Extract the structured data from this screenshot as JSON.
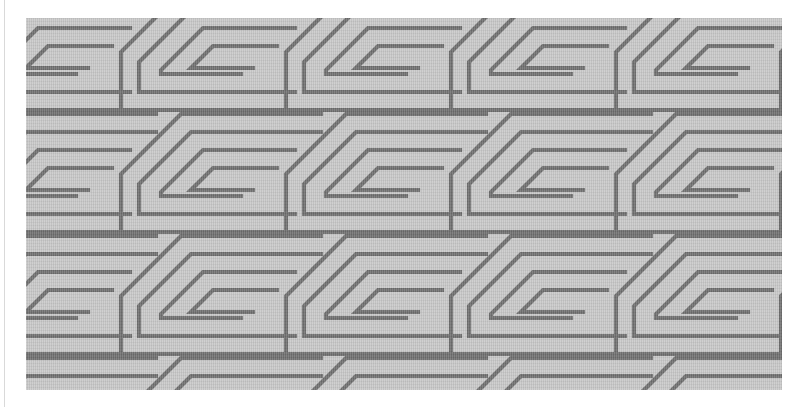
{
  "canvas": {
    "width": 798,
    "height": 407,
    "background_color": "#ffffff",
    "description": "Flat-scan photograph of a woven textile bearing a continuous Greek-key meander fret"
  },
  "left_rule": {
    "color": "#d9d9d9",
    "x": 4,
    "width": 1
  },
  "plate": {
    "x": 26,
    "y": 18,
    "width": 756,
    "height": 372,
    "background_color": "#c8c8c8",
    "line_color": "#6e6e6e",
    "line_width": 4.2,
    "motif_name": "greek-key-meander",
    "alt_names": [
      "labyrinth fret",
      "running spiral",
      "key fret"
    ],
    "texture": "vertical warp weave with faint horizontal grain"
  },
  "pattern": {
    "tile_width": 165,
    "tile_height": 122,
    "columns": 5,
    "rows": 4,
    "skew_degrees": -37,
    "skew_direction": "vertical strokes lean down-left",
    "stroke_spacing": 18,
    "spiral_turns": 2.5,
    "spiral_handedness": "clockwise-inward",
    "orientation": "horizontal bands, left-running"
  },
  "chart_data": {
    "type": "heatmap",
    "xlabel": "",
    "ylabel": "",
    "categories": [
      "column 1",
      "column 2",
      "column 3",
      "column 4",
      "column 5"
    ],
    "series": [
      {
        "name": "band 1",
        "values": [
          1,
          1,
          1,
          1,
          1
        ]
      },
      {
        "name": "band 2",
        "values": [
          1,
          1,
          1,
          1,
          1
        ]
      },
      {
        "name": "band 3",
        "values": [
          1,
          1,
          1,
          1,
          1
        ]
      },
      {
        "name": "band 4",
        "values": [
          1,
          1,
          1,
          1,
          1
        ]
      }
    ],
    "colors": {
      "background": "#c8c8c8",
      "stroke": "#6e6e6e",
      "margin": "#ffffff"
    },
    "grid": false,
    "legend": "none"
  }
}
